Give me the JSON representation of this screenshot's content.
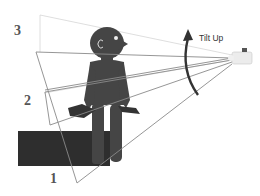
{
  "diagram": {
    "type": "camera-tilt-illustration",
    "labels": {
      "position_1": "1",
      "position_2": "2",
      "position_3": "3",
      "motion": "Tilt Up"
    },
    "colors": {
      "figure": "#444444",
      "box": "#2e2e2e",
      "frame_lines": "#8a8a8a",
      "light_lines": "#d0d0d0",
      "arrow": "#333333",
      "camera": "#e8e8e8"
    },
    "elements": [
      "camera",
      "person-silhouette",
      "dark-box",
      "framing-rectangles",
      "tilt-arrow"
    ]
  }
}
